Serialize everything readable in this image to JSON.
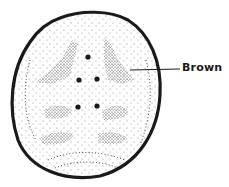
{
  "diagram": {
    "labels": [
      {
        "text": "Brown",
        "points_to": "upper right stippled patch"
      }
    ],
    "colors": {
      "ink": "#1a1a1a",
      "background": "#ffffff"
    },
    "dots_count": 5
  }
}
